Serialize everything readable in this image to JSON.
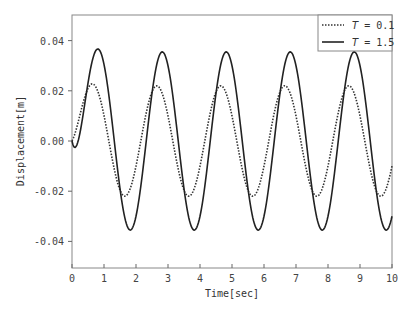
{
  "chart_data": {
    "type": "line",
    "title": "",
    "xlabel": "Time[sec]",
    "ylabel": "Displacement[m]",
    "xlim": [
      0,
      10
    ],
    "ylim": [
      -0.05,
      0.05
    ],
    "xticks": [
      "0",
      "1",
      "2",
      "3",
      "4",
      "5",
      "6",
      "7",
      "8",
      "9",
      "10"
    ],
    "yticks": [
      "0.04",
      "0.02",
      "0.00",
      "-0.02",
      "-0.04"
    ],
    "grid": false,
    "legend_position": "upper right",
    "series": [
      {
        "name": "T = 0.1",
        "style": "dotted",
        "color": "#333333",
        "amplitude": 0.022,
        "period": 2.0,
        "phase_peak_t": 0.65
      },
      {
        "name": "T = 1.5",
        "style": "solid",
        "color": "#222222",
        "amplitude": 0.0355,
        "period": 2.0,
        "phase_peak_t": 0.82
      }
    ]
  },
  "legend": {
    "items": [
      {
        "prefix": "T",
        "suffix": " = 0.1"
      },
      {
        "prefix": "T",
        "suffix": " = 1.5"
      }
    ]
  }
}
